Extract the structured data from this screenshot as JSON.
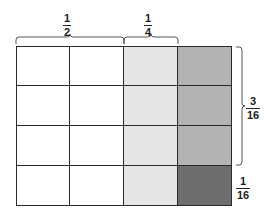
{
  "diagram": {
    "type": "fraction-area-model",
    "rows": 4,
    "cols": 4,
    "colors": {
      "white": "#ffffff",
      "light": "#e6e6e6",
      "medium": "#b3b3b3",
      "dark": "#6e6e6e",
      "line": "#2a2a2a"
    },
    "cell_fills": [
      [
        "white",
        "white",
        "light",
        "medium"
      ],
      [
        "white",
        "white",
        "light",
        "medium"
      ],
      [
        "white",
        "white",
        "light",
        "medium"
      ],
      [
        "white",
        "white",
        "light",
        "dark"
      ]
    ],
    "labels": {
      "half": {
        "numerator": "1",
        "denominator": "2"
      },
      "quarter": {
        "numerator": "1",
        "denominator": "4"
      },
      "three_sixteenths": {
        "numerator": "3",
        "denominator": "16"
      },
      "one_sixteenth": {
        "numerator": "1",
        "denominator": "16"
      }
    }
  }
}
